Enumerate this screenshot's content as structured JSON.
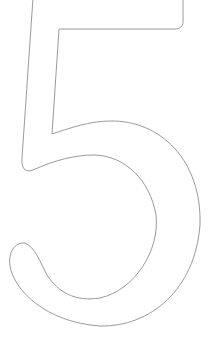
{
  "figure": {
    "glyph": "5",
    "style": "outline",
    "stroke_color": "#9a9a9a",
    "background": "#ffffff",
    "icon": "digit-five-outline-icon"
  }
}
